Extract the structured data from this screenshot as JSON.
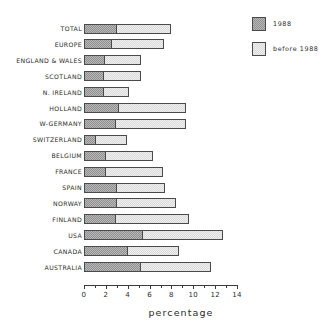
{
  "chart_data": {
    "type": "bar",
    "orientation": "horizontal",
    "stacked": true,
    "title": "",
    "xlabel": "percentage",
    "ylabel": "",
    "xlim": [
      0,
      14
    ],
    "xticks": [
      0,
      2,
      4,
      6,
      8,
      10,
      12,
      14
    ],
    "xtick_labels": [
      "0",
      "2",
      "4",
      "6",
      "8",
      "10",
      "12",
      "14"
    ],
    "minor_tick_step": 1,
    "grid": false,
    "legend_position": "top-right",
    "categories": [
      "TOTAL",
      "EUROPE",
      "ENGLAND & WALES",
      "SCOTLAND",
      "N. IRELAND",
      "HOLLAND",
      "W-GERMANY",
      "SWITZERLAND",
      "BELGIUM",
      "FRANCE",
      "SPAIN",
      "NORWAY",
      "FINLAND",
      "USA",
      "CANADA",
      "AUSTRALIA"
    ],
    "series": [
      {
        "name": "1988",
        "color": "#b9b9b9",
        "values": [
          3.0,
          2.6,
          1.9,
          1.8,
          1.8,
          3.2,
          2.9,
          1.1,
          2.0,
          2.0,
          3.0,
          3.0,
          2.9,
          5.4,
          4.0,
          5.2
        ]
      },
      {
        "name": "before 1988",
        "color": "#ededed",
        "values": [
          5.0,
          4.7,
          3.3,
          3.4,
          2.3,
          6.1,
          6.4,
          2.8,
          4.3,
          5.2,
          4.4,
          5.4,
          6.7,
          7.3,
          4.7,
          6.4
        ]
      }
    ],
    "totals": [
      8.0,
      7.3,
      5.2,
      5.2,
      4.1,
      9.3,
      9.3,
      3.9,
      6.3,
      7.2,
      7.4,
      8.4,
      9.6,
      12.7,
      8.7,
      11.6
    ]
  },
  "legend": {
    "items": [
      {
        "label": "1988",
        "swatch": "dark-hatch-swatch"
      },
      {
        "label": "before 1988",
        "swatch": "light-hatch-swatch"
      }
    ]
  },
  "axis": {
    "x_title": "percentage"
  }
}
